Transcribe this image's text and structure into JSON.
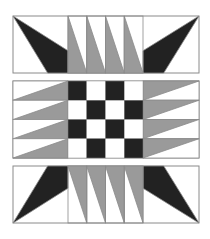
{
  "pattern": {
    "type": "quilt-block",
    "colors": {
      "background": "#ffffff",
      "dark": "#222222",
      "medium": "#9a9a9a",
      "border": "#8a8a8a"
    },
    "bands": [
      {
        "name": "top-band",
        "x0": 13,
        "x1": 199,
        "y0": 16,
        "y1": 73,
        "orientation": "top"
      },
      {
        "name": "middle-band",
        "x0": 13,
        "x1": 199,
        "y0": 81,
        "y1": 158
      },
      {
        "name": "bottom-band",
        "x0": 13,
        "x1": 199,
        "y0": 166,
        "y1": 223,
        "orientation": "bottom"
      }
    ],
    "square_left_x1": 68,
    "square_right_x0": 143,
    "strip_count": 4,
    "checkerboard": [
      [
        "dark",
        "light",
        "dark",
        "light"
      ],
      [
        "light",
        "dark",
        "light",
        "dark"
      ],
      [
        "dark",
        "light",
        "dark",
        "light"
      ],
      [
        "light",
        "dark",
        "light",
        "dark"
      ]
    ]
  }
}
